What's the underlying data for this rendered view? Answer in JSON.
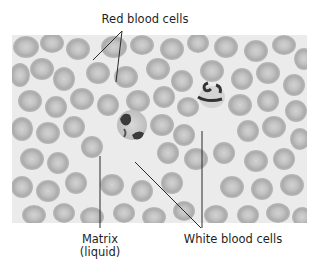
{
  "figure": {
    "labels": {
      "red_blood_cells": "Red blood cells",
      "matrix_line1": "Matrix",
      "matrix_line2": "(liquid)",
      "white_blood_cells": "White blood cells"
    },
    "colors": {
      "background": "#ffffff",
      "plasma": "#e9e9e9",
      "rbc_fill": "#b9b9b9",
      "rbc_center": "#cfcfcf",
      "wbc_nucleus": "#3a3a3a",
      "leader_line": "#2a2a2a"
    }
  }
}
